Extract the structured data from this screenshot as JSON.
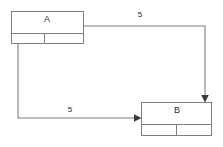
{
  "diagram": {
    "type": "node-edge-graph",
    "background_color": "#ffffff",
    "line_color": "#7f7f7f",
    "text_color": "#2b2b2b",
    "arrow_color": "#3a3a3a",
    "nodes": [
      {
        "id": "A",
        "label": "A",
        "x": 11,
        "y": 11,
        "width": 73,
        "height": 33,
        "header_height": 22,
        "footer_split_x": 44
      },
      {
        "id": "B",
        "label": "B",
        "x": 141,
        "y": 102,
        "width": 71,
        "height": 34,
        "header_height": 22,
        "footer_split_x": 176
      }
    ],
    "edges": [
      {
        "id": "edge-a-to-b-top",
        "from": "A",
        "to": "B",
        "label": "5",
        "label_x": 140,
        "label_y": 15,
        "path": "M 84 26 L 205 26 L 205 99",
        "arrow_direction": "down",
        "arrow_tip_x": 205,
        "arrow_tip_y": 102
      },
      {
        "id": "edge-a-to-b-bottom",
        "from": "A",
        "to": "B",
        "label": "5",
        "label_x": 70,
        "label_y": 110,
        "path": "M 18 44 L 18 118 L 138 118",
        "arrow_direction": "right",
        "arrow_tip_x": 141,
        "arrow_tip_y": 118
      }
    ]
  }
}
